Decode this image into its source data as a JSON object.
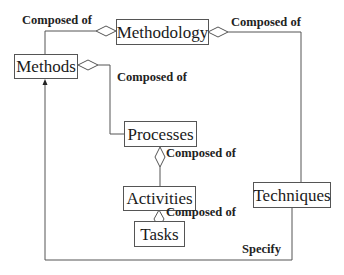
{
  "diagram": {
    "type": "uml-aggregation",
    "nodes": {
      "methodology": "Methodology",
      "methods": "Methods",
      "processes": "Processes",
      "activities": "Activities",
      "tasks": "Tasks",
      "techniques": "Techniques"
    },
    "edge_labels": {
      "methodology_methods": "Composed of",
      "methodology_techniques": "Composed of",
      "methods_processes": "Composed of",
      "processes_activities": "Composed of",
      "activities_tasks": "Composed of",
      "techniques_methods": "Specify"
    },
    "edges": [
      {
        "from": "Methodology",
        "to": "Methods",
        "relation": "Composed of",
        "style": "aggregation"
      },
      {
        "from": "Methodology",
        "to": "Techniques",
        "relation": "Composed of",
        "style": "aggregation"
      },
      {
        "from": "Methods",
        "to": "Processes",
        "relation": "Composed of",
        "style": "aggregation"
      },
      {
        "from": "Processes",
        "to": "Activities",
        "relation": "Composed of",
        "style": "aggregation"
      },
      {
        "from": "Activities",
        "to": "Tasks",
        "relation": "Composed of",
        "style": "aggregation"
      },
      {
        "from": "Techniques",
        "to": "Methods",
        "relation": "Specify",
        "style": "arrow"
      }
    ],
    "colors": {
      "line": "#555555",
      "text": "#1a1a1a",
      "background": "#ffffff"
    }
  }
}
